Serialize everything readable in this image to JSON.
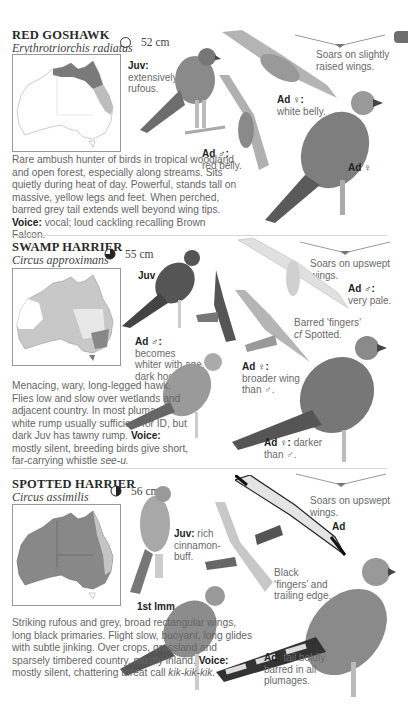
{
  "page_tab": {
    "color": "#6d6d6d"
  },
  "species": [
    {
      "common_name": "RED GOSHAWK",
      "scientific_name": "Erythrotriorchis radiatus",
      "size": "52 cm",
      "size_icon": "empty-circle-icon",
      "flight_silhouette_caption": "Soars on slightly raised wings.",
      "labels": {
        "juv": {
          "tag": "Juv:",
          "text": "extensively rufous."
        },
        "ad_female_flight": {
          "tag": "Ad ♀:",
          "text": "white belly."
        },
        "ad_male": {
          "tag": "Ad ♂:",
          "text": "red belly."
        },
        "ad_female": {
          "tag": "Ad ♀",
          "text": ""
        }
      },
      "description": "Rare ambush hunter of birds in tropical woodland and open forest, especially along streams. Sits quietly during heat of day. Powerful, stands tall on massive, yellow legs and feet. When perched, barred grey tail extends well beyond wing tips.",
      "voice_label": "Voice:",
      "voice": "vocal; loud cackling recalling Brown Falcon."
    },
    {
      "common_name": "SWAMP HARRIER",
      "scientific_name": "Circus approximans",
      "size": "55 cm",
      "size_icon": "three-quarter-circle-icon",
      "flight_silhouette_caption": "Soars on upswept wings.",
      "labels": {
        "juv": {
          "tag": "Juv",
          "text": ""
        },
        "ad_male_pale": {
          "tag": "Ad ♂:",
          "text": "very pale."
        },
        "barred_fingers": {
          "text": "Barred ‘fingers’",
          "text2": "cf",
          "text3": "Spotted."
        },
        "ad_male_hood": {
          "tag": "Ad ♂:",
          "text": "becomes whiter with age, dark hood."
        },
        "ad_female_wing": {
          "tag": "Ad ♀:",
          "text": "broader wing than ♂."
        },
        "ad_female_darker": {
          "tag": "Ad ♀:",
          "text": "darker than ♂."
        }
      },
      "description": "Menacing, wary, long-legged hawk. Flies low and slow over wetlands and adjacent country. In most plumages white rump usually sufficient for ID, but dark Juv has tawny rump.",
      "voice_label": "Voice:",
      "voice": "mostly silent, breeding birds give short, far-carrying whistle",
      "voice_call": "see-u."
    },
    {
      "common_name": "SPOTTED HARRIER",
      "scientific_name": "Circus assimilis",
      "size": "56 cm",
      "size_icon": "half-circle-icon",
      "flight_silhouette_caption": "Soars on upswept wings.",
      "labels": {
        "ad_flight": {
          "tag": "Ad",
          "text": ""
        },
        "juv": {
          "tag": "Juv:",
          "text": "rich cinnamon-buff."
        },
        "black_fingers": {
          "text": "Black ‘fingers’ and trailing edge."
        },
        "first_imm": {
          "tag": "1st Imm",
          "text": ""
        },
        "ad_tail": {
          "tag": "Ad:",
          "text": "tail boldly barred in all plumages."
        }
      },
      "description": "Striking rufous and grey, broad rectangular wings, long black primaries. Flight slow, buoyant, long glides with subtle jinking. Over crops, grassland and sparsely timbered country, mostly inland.",
      "voice_label": "Voice:",
      "voice": "mostly silent, chattering threat call",
      "voice_call": "kik-kik-kik."
    }
  ]
}
